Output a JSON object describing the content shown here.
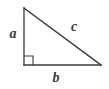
{
  "figure": {
    "name": "right-triangle",
    "type": "geometry-diagram",
    "width": 109,
    "height": 89,
    "background_color": "#ffffff",
    "stroke_color": "#3a3a3c",
    "stroke_width": 1.3,
    "label_color": "#39393b"
  },
  "vertices": {
    "apex": {
      "name": "top-vertex",
      "x": 24,
      "y": 8
    },
    "right_angle": {
      "name": "right-angle-vertex",
      "x": 24,
      "y": 65
    },
    "base_right": {
      "name": "bottom-right-vertex",
      "x": 101,
      "y": 65
    }
  },
  "sides": {
    "vertical_leg": {
      "label": "a",
      "name": "leg-a",
      "x1": 24,
      "y1": 8,
      "x2": 24,
      "y2": 65
    },
    "horizontal_leg": {
      "label": "b",
      "name": "leg-b",
      "x1": 24,
      "y1": 65,
      "x2": 101,
      "y2": 65
    },
    "hypotenuse": {
      "label": "c",
      "name": "hypotenuse-c",
      "x1": 24,
      "y1": 8,
      "x2": 101,
      "y2": 65
    }
  },
  "right_angle_marker": {
    "name": "right-angle-square",
    "size": 9,
    "x": 24,
    "y": 65
  },
  "labels": {
    "a": "a",
    "b": "b",
    "c": "c"
  }
}
